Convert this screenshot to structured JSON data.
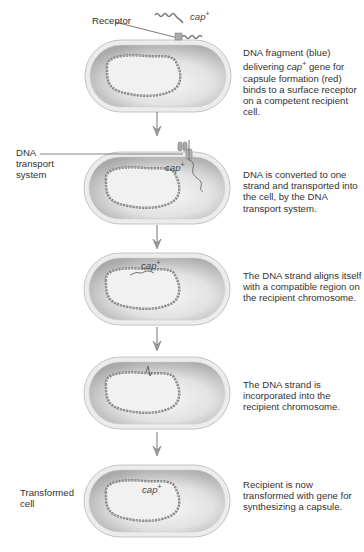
{
  "figure": {
    "colors": {
      "cell_wall": "#e6e6e6",
      "cell_interior_dark": "#b5b5b5",
      "cell_interior_light": "#f4f4f4",
      "dna_strand": "#7a7a7a",
      "arrow": "#8a8a8a",
      "text": "#333333"
    },
    "steps": [
      {
        "id": 1,
        "left_label": "",
        "cap_label": "cap",
        "cap_sup": "+",
        "receptor_label": "Receptor",
        "description_parts": [
          "DNA fragment (blue) delivering ",
          "cap",
          "+",
          " gene for capsule formation (red) binds to a surface receptor on a competent recipient cell."
        ]
      },
      {
        "id": 2,
        "left_label_line1": "DNA",
        "left_label_line2": "transport",
        "left_label_line3": "system",
        "cap_label": "cap",
        "cap_sup": "+",
        "description": "DNA is converted to one strand and transported into the cell, by the DNA transport system."
      },
      {
        "id": 3,
        "cap_label": "cap",
        "cap_sup": "+",
        "description": "The DNA strand aligns itself with a compatible region on the recipient chromosome."
      },
      {
        "id": 4,
        "description": "The DNA strand is incorporated into the recipient chromosome."
      },
      {
        "id": 5,
        "left_label_line1": "Transformed",
        "left_label_line2": "cell",
        "cap_label": "cap",
        "cap_sup": "+",
        "description": "Recipient is now transformed with gene for synthesizing a capsule."
      }
    ]
  }
}
